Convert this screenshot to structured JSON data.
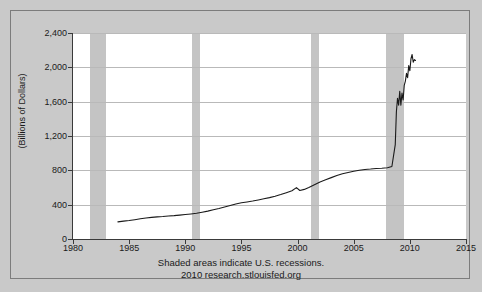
{
  "chart_data": {
    "type": "line",
    "title": "",
    "xlabel": "",
    "ylabel": "(Billions of Dollars)",
    "xlim": [
      1980,
      2015
    ],
    "ylim": [
      0,
      2400
    ],
    "grid": true,
    "legend": "none",
    "xticks": [
      "1980",
      "1985",
      "1990",
      "1995",
      "2000",
      "2005",
      "2010",
      "2015"
    ],
    "xtick_values": [
      1980,
      1985,
      1990,
      1995,
      2000,
      2005,
      2010,
      2015
    ],
    "yticks": [
      "0",
      "400",
      "800",
      "1,200",
      "1,600",
      "2,000",
      "2,400"
    ],
    "ytick_values": [
      0,
      400,
      800,
      1200,
      1600,
      2000,
      2400
    ],
    "annotations": [
      "Shaded areas indicate U.S. recessions.",
      "2010 research.stlouisfed.org"
    ],
    "shaded_regions": [
      {
        "label": "recession-1981-1982",
        "x0": 1981.5,
        "x1": 1982.9
      },
      {
        "label": "recession-1990-1991",
        "x0": 1990.6,
        "x1": 1991.3
      },
      {
        "label": "recession-2001",
        "x0": 2001.2,
        "x1": 2001.9
      },
      {
        "label": "recession-2007-2009",
        "x0": 2007.9,
        "x1": 2009.5
      }
    ],
    "series": [
      {
        "name": "St. Louis Adjusted Monetary Base",
        "color": "#1a1a1a",
        "x": [
          1984.0,
          1984.5,
          1985.0,
          1985.5,
          1986.0,
          1986.5,
          1987.0,
          1987.5,
          1988.0,
          1988.5,
          1989.0,
          1989.5,
          1990.0,
          1990.5,
          1991.0,
          1991.5,
          1992.0,
          1992.5,
          1993.0,
          1993.5,
          1994.0,
          1994.5,
          1995.0,
          1995.5,
          1996.0,
          1996.5,
          1997.0,
          1997.5,
          1998.0,
          1998.5,
          1999.0,
          1999.5,
          1999.9,
          2000.2,
          2000.6,
          2001.0,
          2001.5,
          2002.0,
          2002.5,
          2003.0,
          2003.5,
          2004.0,
          2004.5,
          2005.0,
          2005.5,
          2006.0,
          2006.5,
          2007.0,
          2007.5,
          2008.0,
          2008.4,
          2008.7,
          2008.8,
          2008.9,
          2009.0,
          2009.1,
          2009.2,
          2009.3,
          2009.4,
          2009.5,
          2009.6,
          2009.7,
          2009.8,
          2009.9,
          2010.0,
          2010.1,
          2010.2,
          2010.3,
          2010.4,
          2010.5
        ],
        "y": [
          200,
          208,
          215,
          225,
          235,
          245,
          252,
          258,
          262,
          268,
          272,
          278,
          285,
          292,
          300,
          312,
          325,
          340,
          355,
          372,
          390,
          408,
          422,
          432,
          442,
          455,
          468,
          482,
          498,
          518,
          540,
          562,
          598,
          565,
          578,
          600,
          632,
          665,
          690,
          715,
          740,
          760,
          775,
          790,
          800,
          810,
          815,
          822,
          825,
          830,
          845,
          1100,
          1480,
          1640,
          1560,
          1720,
          1560,
          1700,
          1620,
          1790,
          1840,
          1930,
          1880,
          2020,
          1960,
          2100,
          2150,
          2060,
          2090,
          2080
        ]
      }
    ]
  },
  "footnote": {
    "line1": "Shaded areas indicate U.S. recessions.",
    "line2": "2010 research.stlouisfed.org"
  },
  "axis": {
    "y_title": "(Billions of Dollars)"
  }
}
